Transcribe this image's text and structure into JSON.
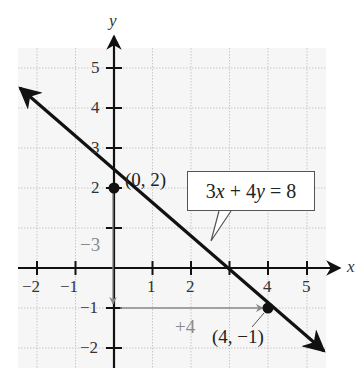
{
  "chart_data": {
    "type": "line",
    "title": "",
    "xlabel": "x",
    "ylabel": "y",
    "xlim": [
      -2.5,
      5.5
    ],
    "ylim": [
      -2.5,
      5.5
    ],
    "grid": true,
    "x_ticks": [
      -2,
      -1,
      1,
      2,
      3,
      4,
      5
    ],
    "x_tick_labels": [
      "−2",
      "−1",
      "1",
      "2",
      "",
      "4",
      "5"
    ],
    "y_ticks": [
      -2,
      -1,
      1,
      2,
      3,
      4,
      5
    ],
    "y_tick_labels": [
      "−2",
      "−1",
      "",
      "2",
      "3",
      "4",
      "5"
    ],
    "series": [
      {
        "name": "3x + 4y = 8",
        "equation": "3x + 4y = 8",
        "slope": -0.75,
        "y_intercept": 2,
        "x": [
          -2.44,
          5.3
        ],
        "y": [
          4.5,
          -2.07
        ],
        "arrows": "both"
      }
    ],
    "points": [
      {
        "label": "(0, 2)",
        "x": 0,
        "y": 2
      },
      {
        "label": "(4, −1)",
        "x": 4,
        "y": -1
      }
    ],
    "annotations": [
      {
        "text": "−3",
        "type": "rise",
        "from": [
          0,
          2
        ],
        "to": [
          0,
          -1
        ],
        "color": "#8a8a8a"
      },
      {
        "text": "+4",
        "type": "run",
        "from": [
          0,
          -1
        ],
        "to": [
          4,
          -1
        ],
        "color": "#8a8a8a"
      },
      {
        "text": "3x + 4y = 8",
        "type": "callout"
      }
    ]
  },
  "labels": {
    "x_axis": "x",
    "y_axis": "y",
    "equation": "3x + 4y = 8",
    "point_a": "(0, 2)",
    "point_b": "(4, −1)",
    "rise": "−3",
    "run": "+4",
    "xt_m2": "−2",
    "xt_m1": "−1",
    "xt_1": "1",
    "xt_2": "2",
    "xt_4": "4",
    "xt_5": "5",
    "yt_5": "5",
    "yt_4": "4",
    "yt_3": "3",
    "yt_2": "2",
    "yt_m1": "−1",
    "yt_m2": "−2"
  },
  "colors": {
    "line": "#111111",
    "axis": "#111111",
    "annotation": "#8a8a8a",
    "grid": "#c8c8c8",
    "plot_bg": "#f6f6f6"
  }
}
